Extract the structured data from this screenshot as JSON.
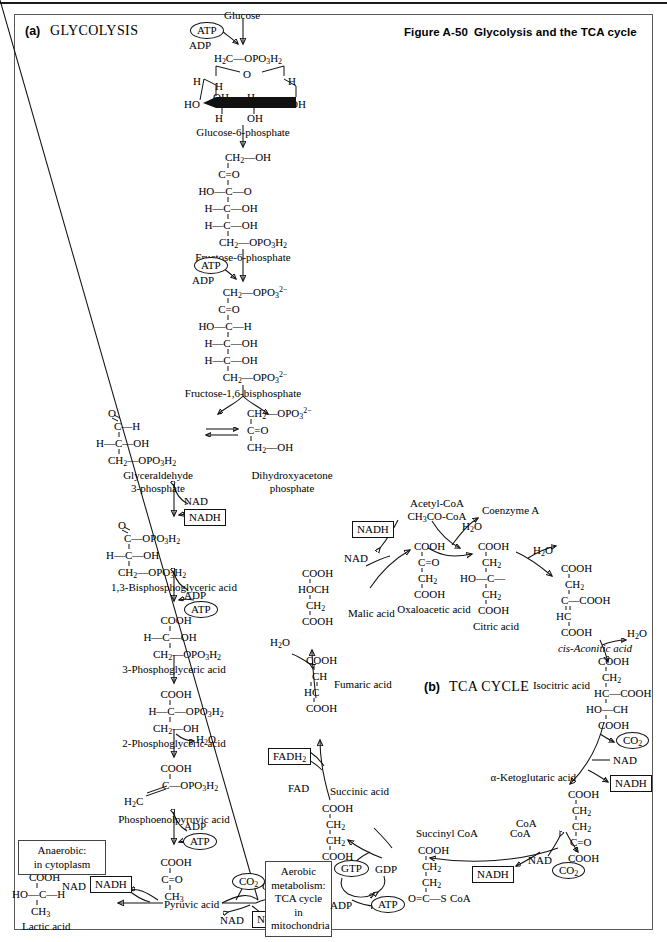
{
  "figure": {
    "number": "Figure A-50",
    "title": "Glycolysis and the TCA cycle"
  },
  "panels": {
    "a": {
      "tag": "(a)",
      "name": "GLYCOLYSIS"
    },
    "b": {
      "tag": "(b)",
      "name": "TCA CYCLE"
    }
  },
  "glycolysis": {
    "glucose_label": "Glucose",
    "atp_1": "ATP",
    "adp_1": "ADP",
    "g6p": {
      "name": "Glucose-6-phosphate",
      "ring_top": "H₂C—OPO₃H₂",
      "ring_o": "O",
      "h_left_up": "H",
      "h_mid_up": "H",
      "h_right_up": "H",
      "ho_left": "HO",
      "oh_inner": "OH",
      "h_inner": "H",
      "oh_right": "OH",
      "h_bottom": "H",
      "oh_bottom": "OH"
    },
    "f6p": {
      "name": "Fructose-6-phosphate",
      "lines": [
        "CH₂—OH",
        "C=O",
        "HO—C—O",
        "H—C—OH",
        "H—C—OH",
        "CH₂—OPO₃H₂"
      ]
    },
    "atp_2": "ATP",
    "adp_2": "ADP",
    "fbp": {
      "name": "Fructose-1,6-bisphosphate",
      "lines": [
        "CH₂—OPO₃²⁻",
        "C=O",
        "HO—C—H",
        "H—C—OH",
        "H—C—OH",
        "CH₂—OPO₃²⁻"
      ]
    },
    "g3p": {
      "name_line1": "Glyceraldehyde",
      "name_line2": "3-phosphate",
      "o_top": "O",
      "lines": [
        "C—H",
        "H—C—OH",
        "CH₂—OPO₃H₂"
      ]
    },
    "dhap": {
      "name_line1": "Dihydroxyacetone",
      "name_line2": "phosphate",
      "lines": [
        "CH₂—OPO₃²⁻",
        "C=O",
        "CH₂—OH"
      ]
    },
    "nad_1": "NAD",
    "nadh_1": "NADH",
    "bpg": {
      "name": "1,3-Bisphosphoglyceric acid",
      "o_top": "O",
      "lines": [
        "C—OPO₃H₂",
        "H—C—OH",
        "CH₂—OPO₃H₂"
      ]
    },
    "adp_3": "ADP",
    "atp_3": "ATP",
    "pg3": {
      "name": "3-Phosphoglyceric acid",
      "lines": [
        "COOH",
        "H—C—OH",
        "CH₂—OPO₃H₂"
      ]
    },
    "pg2": {
      "name": "2-Phosphoglyceric acid",
      "lines": [
        "COOH",
        "H—C—OPO₃H₂",
        "CH₂—OH"
      ]
    },
    "water_1": "H₂O",
    "pep": {
      "name": "Phosphoenolpyruvic acid",
      "line_cooh": "COOH",
      "line_c": "C—OPO₃H₂",
      "line_ch2": "H₂C"
    },
    "adp_4": "ADP",
    "atp_4": "ATP",
    "pyruvate": {
      "name": "Pyruvic acid",
      "lines": [
        "COOH",
        "C=O",
        "CH₃"
      ]
    },
    "nad_2": "NAD",
    "nadh_2": "NADH",
    "lactate": {
      "name": "Lactic acid",
      "lines": [
        "COOH",
        "HO—C—H",
        "CH₃"
      ]
    },
    "co2": "CO₂",
    "coa": "CoA",
    "nad_3": "NAD",
    "nadh_3": "NADH",
    "anaerobic_note_line1": "Anaerobic:",
    "anaerobic_note_line2": "in cytoplasm",
    "aerobic_note_line1": "Aerobic",
    "aerobic_note_line2": "metabolism:",
    "aerobic_note_line3": "TCA cycle in",
    "aerobic_note_line4": "mitochondria"
  },
  "tca": {
    "acetyl_coa_line1": "Acetyl-CoA",
    "acetyl_coa_line2": "CH₃CO-CoA",
    "coenzyme_a": "Coenzyme A",
    "water_in": "H₂O",
    "nad_mal": "NAD",
    "nadh_mal": "NADH",
    "oxaloacetate": {
      "name": "Oxaloacetic acid",
      "lines": [
        "COOH",
        "C=O",
        "CH₂",
        "COOH"
      ]
    },
    "citrate": {
      "name": "Citric acid",
      "lines": [
        "COOH",
        "CH₂",
        "HO—C—",
        "CH₂",
        "COOH"
      ]
    },
    "water_cit": "H₂O",
    "aconitate": {
      "name": "cis-Aconitic acid",
      "lines": [
        "COOH",
        "CH₂",
        "C—COOH",
        "HC",
        "COOH"
      ]
    },
    "water_aco": "H₂O",
    "isocitrate": {
      "name": "Isocitric acid",
      "lines": [
        "COOH",
        "CH₂",
        "HC—COOH",
        "HO—CH",
        "COOH"
      ]
    },
    "co2_iso": "CO₂",
    "nad_iso": "NAD",
    "nadh_iso": "NADH",
    "ketoglutarate": {
      "name": "α-Ketoglutaric acid",
      "lines": [
        "COOH",
        "CH₂",
        "CH₂",
        "C=O",
        "COOH"
      ]
    },
    "coa_kg": "CoA",
    "nad_kg": "NAD",
    "nadh_kg": "NADH",
    "co2_kg": "CO₂",
    "succinyl_coa": {
      "name": "Succinyl CoA",
      "lines": [
        "COOH",
        "CH₂",
        "CH₂",
        "O=C—S",
        "CoA"
      ]
    },
    "coa_succ": "CoA",
    "gtp": "GTP",
    "gdp": "GDP",
    "adp": "ADP",
    "atp": "ATP",
    "succinate": {
      "name": "Succinic acid",
      "lines": [
        "COOH",
        "CH₂",
        "CH₂",
        "COOH"
      ]
    },
    "fad": "FAD",
    "fadh2": "FADH₂",
    "fumarate": {
      "name": "Fumaric acid",
      "lines": [
        "COOH",
        "CH",
        "HC",
        "COOH"
      ]
    },
    "water_fum": "H₂O",
    "malate": {
      "name": "Malic acid",
      "lines": [
        "COOH",
        "HOCH",
        "CH₂",
        "COOH"
      ]
    }
  }
}
